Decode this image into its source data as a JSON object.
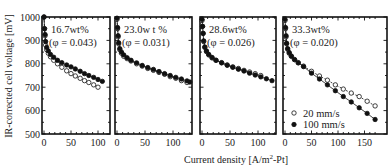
{
  "chart_data": {
    "type": "scatter",
    "title": "",
    "xlabel": "Current density [A/m²-Pt]",
    "ylabel": "IR-corrected cell voltage [mV]",
    "ylim": [
      500,
      1000
    ],
    "yticks": [
      500,
      600,
      700,
      800,
      900,
      1000
    ],
    "grid": false,
    "legend": {
      "position": "lower-left of panel 4",
      "entries": [
        {
          "label": "20 mm/s",
          "marker": "open-circle"
        },
        {
          "label": "100 mm/s",
          "marker": "filled-circle"
        }
      ]
    },
    "panels": [
      {
        "label": "16.7wt%",
        "phi": "(φ = 0.043)",
        "xlim": [
          0,
          115
        ],
        "xticks": [
          0,
          50,
          100
        ],
        "series": [
          {
            "name": "20 mm/s",
            "marker": "open",
            "x": [
              0,
              1,
              2,
              3,
              5,
              8,
              12,
              18,
              25,
              33,
              42,
              50,
              58,
              67,
              75,
              83,
              92,
              100
            ],
            "y": [
              1000,
              950,
              920,
              880,
              860,
              845,
              830,
              815,
              800,
              785,
              770,
              758,
              748,
              738,
              728,
              720,
              710,
              700
            ]
          },
          {
            "name": "100 mm/s",
            "marker": "filled",
            "x": [
              0,
              1,
              2,
              3,
              5,
              8,
              12,
              18,
              25,
              33,
              42,
              50,
              58,
              67,
              75,
              83,
              92,
              100,
              108
            ],
            "y": [
              1000,
              950,
              925,
              895,
              870,
              855,
              840,
              828,
              815,
              805,
              795,
              787,
              778,
              768,
              758,
              750,
              742,
              733,
              725
            ]
          }
        ]
      },
      {
        "label": "23.0w t %",
        "phi": "(φ = 0.031)",
        "xlim": [
          0,
          135
        ],
        "xticks": [
          0,
          50,
          100
        ],
        "series": [
          {
            "name": "20 mm/s",
            "marker": "open",
            "x": [
              0,
              1,
              2,
              3,
              5,
              8,
              12,
              18,
              25,
              35,
              45,
              55,
              65,
              75,
              85,
              95,
              105,
              115,
              125
            ],
            "y": [
              990,
              950,
              915,
              885,
              860,
              845,
              832,
              822,
              812,
              800,
              790,
              780,
              772,
              763,
              755,
              745,
              738,
              728,
              720
            ]
          },
          {
            "name": "100 mm/s",
            "marker": "filled",
            "x": [
              0,
              1,
              2,
              3,
              5,
              8,
              12,
              18,
              25,
              35,
              45,
              55,
              65,
              75,
              85,
              95,
              105,
              115,
              125,
              130
            ],
            "y": [
              995,
              955,
              920,
              890,
              865,
              850,
              838,
              826,
              815,
              804,
              793,
              784,
              776,
              767,
              758,
              750,
              742,
              735,
              727,
              722
            ]
          }
        ]
      },
      {
        "label": "28.6wt%",
        "phi": "(φ = 0.026)",
        "xlim": [
          0,
          135
        ],
        "xticks": [
          0,
          50,
          100
        ],
        "series": [
          {
            "name": "20 mm/s",
            "marker": "open",
            "x": [
              0,
              1,
              2,
              3,
              5,
              8,
              12,
              18,
              25,
              35,
              45,
              55,
              65,
              75,
              85,
              95,
              105
            ],
            "y": [
              985,
              960,
              930,
              895,
              870,
              852,
              838,
              825,
              815,
              805,
              795,
              787,
              780,
              772,
              765,
              758,
              750
            ]
          },
          {
            "name": "100 mm/s",
            "marker": "filled",
            "x": [
              0,
              1,
              2,
              3,
              5,
              8,
              12,
              18,
              25,
              35,
              45,
              55,
              65,
              75,
              85,
              95,
              105,
              115,
              125
            ],
            "y": [
              990,
              960,
              930,
              898,
              872,
              855,
              840,
              827,
              815,
              804,
              794,
              785,
              777,
              769,
              760,
              752,
              744,
              736,
              728
            ]
          }
        ]
      },
      {
        "label": "33.3wt%",
        "phi": "(φ = 0.020)",
        "xlim": [
          0,
          175
        ],
        "xticks": [
          0,
          50,
          100,
          150
        ],
        "series": [
          {
            "name": "20 mm/s",
            "marker": "open",
            "x": [
              0,
              1,
              2,
              3,
              5,
              8,
              12,
              18,
              25,
              35,
              50,
              65,
              80,
              95,
              110,
              125,
              140,
              155,
              170
            ],
            "y": [
              985,
              950,
              915,
              885,
              862,
              845,
              832,
              818,
              805,
              790,
              768,
              748,
              730,
              710,
              692,
              675,
              660,
              640,
              620
            ]
          },
          {
            "name": "100 mm/s",
            "marker": "filled",
            "x": [
              0,
              1,
              2,
              3,
              5,
              8,
              12,
              18,
              25,
              35,
              50,
              65,
              80,
              95,
              110,
              125,
              140,
              155,
              170
            ],
            "y": [
              990,
              955,
              920,
              888,
              865,
              848,
              833,
              818,
              804,
              788,
              760,
              735,
              710,
              685,
              660,
              637,
              612,
              588,
              562
            ]
          }
        ]
      }
    ]
  },
  "labels": {
    "ylabel": "IR-corrected cell voltage [mV]",
    "xlabel_main": "Current density [A/m",
    "xlabel_sup": "2",
    "xlabel_tail": "-Pt]",
    "legend_open": "20 mm/s",
    "legend_filled": "100 mm/s"
  }
}
